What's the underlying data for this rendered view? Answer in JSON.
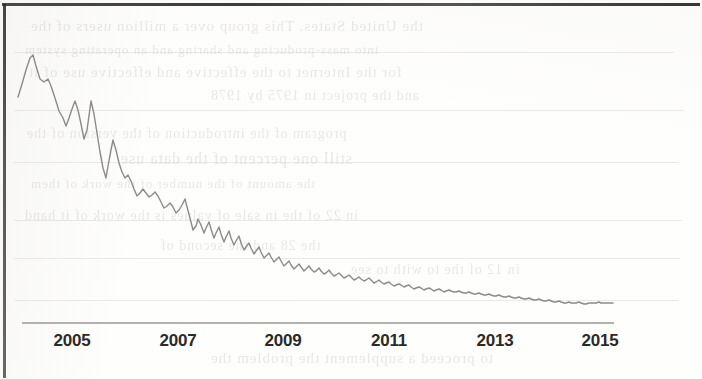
{
  "page": {
    "kind": "scanned-book-page",
    "background_color": "#fdfdfc",
    "border_color": "#2e2c2a"
  },
  "ghost_text": {
    "note": "faint bleed-through text visible from the reverse side of the scanned page",
    "color": "#c9c7c4",
    "lines": [
      {
        "text": "the United States. This group over a million users of the",
        "x": 30,
        "y": 18,
        "size": 15
      },
      {
        "text": "into mass-producing and sharing and an operating system",
        "x": 24,
        "y": 42,
        "size": 13
      },
      {
        "text": "for the Internet to the effective and effective use of it",
        "x": 28,
        "y": 64,
        "size": 15
      },
      {
        "text": "and the project in 1975 by 1978",
        "x": 210,
        "y": 88,
        "size": 14
      },
      {
        "text": "program of the introduction of the version of the",
        "x": 26,
        "y": 126,
        "size": 14
      },
      {
        "text": "still one percent of the data use",
        "x": 120,
        "y": 150,
        "size": 16
      },
      {
        "text": "the amount of the number of the work of them",
        "x": 30,
        "y": 176,
        "size": 13
      },
      {
        "text": "in 22 of the in sale of values is the work of it hand",
        "x": 24,
        "y": 208,
        "size": 14
      },
      {
        "text": "the 28 and the second of",
        "x": 160,
        "y": 238,
        "size": 14
      },
      {
        "text": "in 12 of the to with to see",
        "x": 350,
        "y": 262,
        "size": 14
      },
      {
        "text": "to proceed a supplement the problem the",
        "x": 210,
        "y": 350,
        "size": 15
      }
    ],
    "rules": [
      {
        "x": 14,
        "y": 52,
        "w": 660
      },
      {
        "x": 14,
        "y": 110,
        "w": 670
      },
      {
        "x": 14,
        "y": 162,
        "w": 665
      },
      {
        "x": 14,
        "y": 220,
        "w": 668
      },
      {
        "x": 14,
        "y": 258,
        "w": 666
      },
      {
        "x": 14,
        "y": 300,
        "w": 664
      }
    ]
  },
  "chart_data": {
    "type": "line",
    "title": "",
    "subtitle": "",
    "xlabel": "",
    "ylabel": "",
    "grid": false,
    "legend": null,
    "axis": {
      "x_axis_line": true,
      "y_axis_line": false,
      "x_axis_color": "#9a9895",
      "x_range": [
        2004.0,
        2015.95
      ],
      "tick_labels": [
        "2005",
        "2007",
        "2009",
        "2011",
        "2013",
        "2015"
      ],
      "tick_values": [
        2005,
        2007,
        2009,
        2011,
        2013,
        2015
      ]
    },
    "series": [
      {
        "name": "monthly series",
        "color": "#8d8b88",
        "line_width": 1.4,
        "x_start": 2004.0,
        "x_step": 0.08333,
        "values": [
          62,
          71,
          79,
          88,
          96,
          89,
          83,
          80,
          76,
          82,
          76,
          71,
          65,
          60,
          72,
          66,
          55,
          48,
          52,
          49,
          59,
          54,
          48,
          45,
          46,
          62,
          51,
          47,
          44,
          42,
          41,
          60,
          55,
          48,
          42,
          38,
          36,
          40,
          37,
          34,
          32,
          33,
          31,
          30,
          29,
          33,
          31,
          28,
          27,
          26,
          30,
          28,
          26,
          24,
          23,
          25,
          26,
          24,
          22,
          21,
          22,
          20,
          24,
          22,
          20,
          19,
          21,
          19,
          18,
          20,
          19,
          18,
          17,
          19,
          18,
          17,
          16,
          18,
          17,
          16,
          15,
          17,
          16,
          15,
          14,
          16,
          17,
          16,
          15,
          14,
          15,
          14,
          13,
          15,
          14,
          13,
          13,
          14,
          13,
          12,
          13,
          12,
          12,
          13,
          12,
          11,
          12,
          11,
          11,
          12,
          11,
          11,
          12,
          11,
          10,
          11,
          11,
          10,
          11,
          10,
          10,
          11,
          10,
          10,
          11,
          10,
          10,
          11,
          10,
          10,
          10,
          9,
          10,
          10,
          9,
          10,
          10,
          9,
          10,
          9,
          9,
          10,
          9,
          9
        ]
      }
    ]
  },
  "chart_geometry": {
    "note": "pixel path control points traced from the scan (x,y in page coordinates)",
    "axis_y": 323,
    "axis_x_start": 22,
    "axis_x_end": 614,
    "tick_label_x": [
      72,
      178,
      283,
      389,
      495,
      600
    ],
    "path": "18,97 22,84 26,70 30,58 33,55 36,66 40,79 44,82 48,79 51,86 55,98 59,111 63,118 66,126 69,118 72,109 75,101 78,110 81,124 84,139 87,130 89,116 91,101 94,114 97,133 100,152 103,168 106,178 108,166 111,150 113,140 116,150 119,163 122,172 125,178 128,175 131,181 134,189 137,196 140,193 143,189 146,193 149,197 152,195 155,192 158,196 161,202 164,208 167,206 170,203 173,207 176,213 179,210 182,205 185,199 187,207 190,218 193,230 196,226 198,219 201,225 204,233 206,228 209,222 211,229 214,238 216,233 219,227 221,234 224,242 226,237 229,231 231,238 234,245 236,241 239,236 241,243 244,250 246,247 249,243 251,248 254,254 256,251 259,247 261,252 264,258 266,256 269,253 271,257 274,262 276,260 279,257 281,261 284,266 286,264 289,261 291,265 294,269 296,267 299,264 301,267 304,271 306,269 309,266 311,269 314,272 316,271 319,268 321,271 324,274 326,273 329,270 331,273 334,276 336,275 339,273 341,275 344,278 346,277 349,275 351,277 354,280 356,279 359,277 361,279 364,281 366,280 369,278 371,280 374,283 376,282 379,280 381,282 384,284 386,283 389,282 391,284 394,286 396,285 399,284 401,285 404,287 406,286 409,285 411,287 414,289 416,288 419,287 421,288 424,290 426,289 429,288 431,289 434,291 436,290 439,289 441,290 444,292 446,291 449,290 451,291 454,292 456,292 459,291 461,292 464,293 466,293 469,292 471,293 474,294 476,294 479,293 481,294 484,295 486,295 489,294 491,295 494,296 496,296 499,295 501,296 504,297 506,297 509,296 511,297 514,298 516,298 519,297 521,298 524,299 526,299 529,298 531,299 534,300 536,300 539,299 541,300 544,301 546,301 549,300 551,301 554,302 556,302 559,301 561,302 564,303 566,303 569,302 571,303 574,303 576,303 579,302 581,303 584,304 586,304 589,303 591,303 594,303 596,303 599,302 601,303 604,303 607,303 610,303 613,303"
  },
  "tick_labels": [
    "2005",
    "2007",
    "2009",
    "2011",
    "2013",
    "2015"
  ]
}
